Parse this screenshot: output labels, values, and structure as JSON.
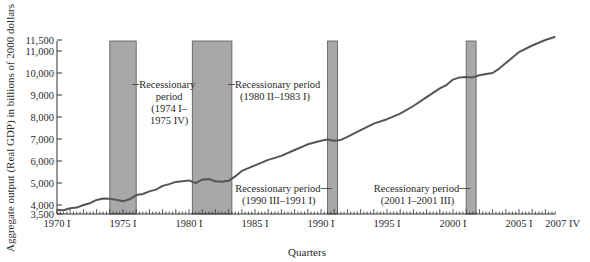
{
  "chart_data": {
    "type": "line",
    "title": "",
    "xlabel": "Quarters",
    "ylabel": "Aggregate output (Real GDP) in billions of 2000 dollars",
    "ylim": [
      3500,
      11500
    ],
    "xlim": [
      1970.0,
      2007.75
    ],
    "grid": false,
    "legend": null,
    "y_ticks": [
      3500,
      4000,
      5000,
      6000,
      7000,
      8000,
      9000,
      10000,
      11000,
      11500
    ],
    "y_tick_labels": [
      "3,500",
      "4,000",
      "5,000",
      "6,000",
      "7,000",
      "8,000",
      "9,000",
      "10,000",
      "11,000",
      "11,500"
    ],
    "x_ticks": [
      1970.0,
      1975.0,
      1980.0,
      1985.0,
      1990.0,
      1995.0,
      2000.0,
      2005.0,
      2007.75
    ],
    "x_tick_labels": [
      "1970 I",
      "1975 I",
      "1980 I",
      "1985 I",
      "1990 I",
      "1995 I",
      "2000 I",
      "2005 I",
      "2007 IV"
    ],
    "series": [
      {
        "name": "Real GDP",
        "color": "#555555",
        "x": [
          1970.0,
          1970.5,
          1971.0,
          1971.5,
          1972.0,
          1972.5,
          1973.0,
          1973.5,
          1974.0,
          1974.5,
          1975.0,
          1975.5,
          1976.0,
          1976.5,
          1977.0,
          1977.5,
          1978.0,
          1978.5,
          1979.0,
          1979.5,
          1980.0,
          1980.5,
          1981.0,
          1981.5,
          1982.0,
          1982.5,
          1983.0,
          1983.5,
          1984.0,
          1985.0,
          1986.0,
          1987.0,
          1988.0,
          1989.0,
          1990.0,
          1990.5,
          1991.0,
          1991.5,
          1992.0,
          1993.0,
          1994.0,
          1995.0,
          1996.0,
          1997.0,
          1998.0,
          1999.0,
          1999.5,
          2000.0,
          2000.5,
          2001.0,
          2001.5,
          2002.0,
          2002.5,
          2003.0,
          2003.5,
          2004.0,
          2005.0,
          2006.0,
          2007.0,
          2007.75
        ],
        "values": [
          3770,
          3760,
          3850,
          3880,
          4000,
          4080,
          4230,
          4290,
          4280,
          4240,
          4170,
          4260,
          4450,
          4500,
          4620,
          4700,
          4870,
          4950,
          5050,
          5080,
          5120,
          5000,
          5150,
          5180,
          5080,
          5060,
          5100,
          5300,
          5550,
          5800,
          6050,
          6230,
          6500,
          6760,
          6920,
          6980,
          6920,
          6960,
          7100,
          7400,
          7700,
          7900,
          8150,
          8500,
          8900,
          9300,
          9450,
          9700,
          9800,
          9820,
          9800,
          9900,
          9960,
          10000,
          10200,
          10450,
          10950,
          11250,
          11500,
          11650
        ]
      }
    ],
    "recessions": [
      {
        "start": 1974.0,
        "end": 1976.0,
        "label_lines": [
          "Recessionary",
          "period",
          "(1974 I–",
          "1975 IV)"
        ],
        "label_side": "right"
      },
      {
        "start": 1980.25,
        "end": 1983.25,
        "label_lines": [
          "Recessionary period",
          "(1980 II–1983 I)"
        ],
        "label_side": "right"
      },
      {
        "start": 1990.5,
        "end": 1991.25,
        "label_lines": [
          "Recessionary period",
          "(1990 III–1991 I)"
        ],
        "label_side": "left"
      },
      {
        "start": 2001.0,
        "end": 2001.75,
        "label_lines": [
          "Recessionary period",
          "(2001 I–2001 III)"
        ],
        "label_side": "left"
      }
    ],
    "recession_color": "#a8a8a8"
  }
}
